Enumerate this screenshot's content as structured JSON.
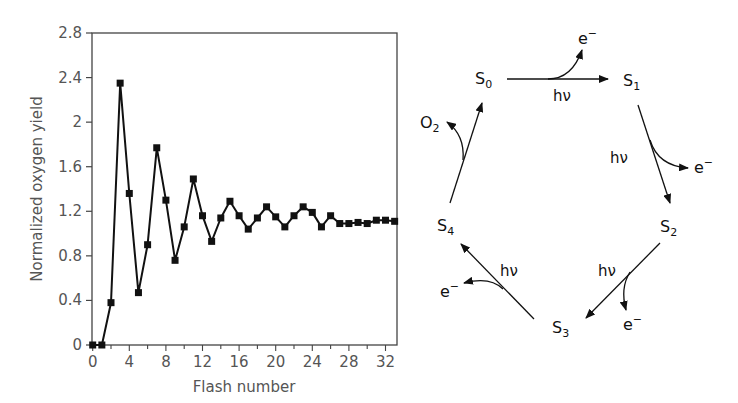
{
  "chart_data": {
    "type": "line",
    "title": "",
    "xlabel": "Flash number",
    "ylabel": "Normalized oxygen yield",
    "xlim": [
      0,
      33.5
    ],
    "ylim": [
      0,
      2.8
    ],
    "xticks": [
      0,
      4,
      8,
      12,
      16,
      20,
      24,
      28,
      32
    ],
    "yticks": [
      0,
      0.4,
      0.8,
      1.2,
      1.6,
      2,
      2.4,
      2.8
    ],
    "ytick_labels": [
      "0",
      "0.4",
      "0.8",
      "1.2",
      "1.6",
      "2",
      "2.4",
      "2.8"
    ],
    "grid": false,
    "marker": "square",
    "series": [
      {
        "name": "Oxygen yield per flash",
        "x": [
          0,
          1,
          2,
          3,
          4,
          5,
          6,
          7,
          8,
          9,
          10,
          11,
          12,
          13,
          14,
          15,
          16,
          17,
          18,
          19,
          20,
          21,
          22,
          23,
          24,
          25,
          26,
          27,
          28,
          29,
          30,
          31,
          32,
          33
        ],
        "values": [
          0,
          0,
          0.38,
          2.35,
          1.36,
          0.47,
          0.9,
          1.77,
          1.3,
          0.76,
          1.06,
          1.49,
          1.16,
          0.93,
          1.14,
          1.29,
          1.16,
          1.04,
          1.14,
          1.24,
          1.15,
          1.06,
          1.16,
          1.24,
          1.19,
          1.06,
          1.16,
          1.09,
          1.09,
          1.1,
          1.09,
          1.12,
          1.12,
          1.11
        ]
      }
    ]
  },
  "diagram": {
    "states": [
      {
        "id": "S0",
        "base": "S",
        "sub": "0"
      },
      {
        "id": "S1",
        "base": "S",
        "sub": "1"
      },
      {
        "id": "S2",
        "base": "S",
        "sub": "2"
      },
      {
        "id": "S3",
        "base": "S",
        "sub": "3"
      },
      {
        "id": "S4",
        "base": "S",
        "sub": "4"
      }
    ],
    "transitions": [
      {
        "from": "S0",
        "to": "S1",
        "input": "hν",
        "output": "e⁻"
      },
      {
        "from": "S1",
        "to": "S2",
        "input": "hν",
        "output": "e⁻"
      },
      {
        "from": "S2",
        "to": "S3",
        "input": "hν",
        "output": "e⁻"
      },
      {
        "from": "S3",
        "to": "S4",
        "input": "hν",
        "output": "e⁻"
      },
      {
        "from": "S4",
        "to": "S0",
        "input": "",
        "output": "O₂"
      }
    ],
    "labels": {
      "hv": "hν",
      "electron_base": "e",
      "electron_sup": "−",
      "oxygen_base": "O",
      "oxygen_sub": "2"
    }
  },
  "colors": {
    "line": "#111111",
    "axis": "#444444",
    "text": "#555555",
    "diagram": "#111111"
  }
}
